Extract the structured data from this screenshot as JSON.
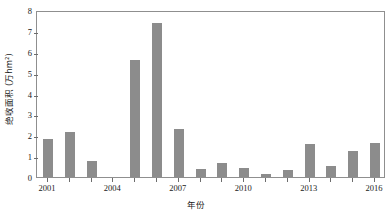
{
  "chart_data": {
    "type": "bar",
    "title": "",
    "xlabel": "年份",
    "ylabel": "绝收面积 (万hm²)",
    "categories": [
      "2001",
      "2002",
      "2003",
      "2004",
      "2005",
      "2006",
      "2007",
      "2008",
      "2009",
      "2010",
      "2011",
      "2012",
      "2013",
      "2014",
      "2015",
      "2016"
    ],
    "values": [
      1.8,
      2.15,
      0.75,
      0.0,
      5.6,
      7.4,
      2.3,
      0.4,
      0.65,
      0.45,
      0.15,
      0.35,
      1.6,
      0.55,
      1.25,
      1.65
    ],
    "ylim": [
      0,
      8
    ],
    "xlim_categories": 16,
    "y_ticks": [
      0,
      1,
      2,
      3,
      4,
      5,
      6,
      7,
      8
    ],
    "y_tick_labels": [
      "0",
      "1",
      "2",
      "3",
      "4",
      "5",
      "6",
      "7",
      "8"
    ],
    "x_tick_labels": [
      "2001",
      "2004",
      "2007",
      "2010",
      "2013",
      "2016"
    ],
    "x_tick_categories": [
      "2001",
      "2004",
      "2007",
      "2010",
      "2013",
      "2016"
    ],
    "grid": false,
    "legend": null,
    "legend_position": "none",
    "bar_color": "#8c8c8c",
    "axis_color": "#8f8f8f",
    "text_color": "#1a1a1a",
    "background_color": "#ffffff"
  }
}
